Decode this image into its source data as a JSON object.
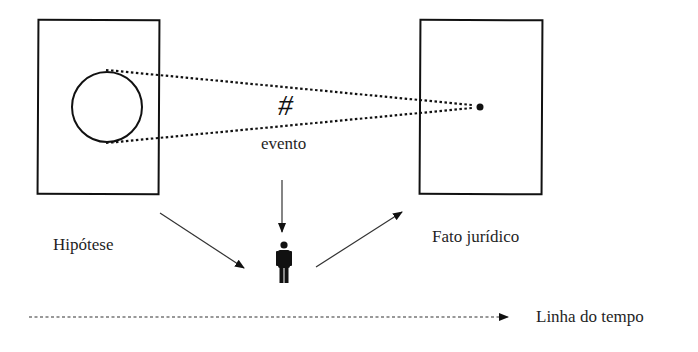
{
  "diagram": {
    "labels": {
      "hypothesis": "Hipótese",
      "legal_fact": "Fato jurídico",
      "event": "evento",
      "event_symbol": "#",
      "timeline": "Linha do tempo"
    },
    "icons": {
      "person": "person-icon"
    },
    "colors": {
      "stroke": "#111111",
      "background": "#ffffff"
    }
  }
}
